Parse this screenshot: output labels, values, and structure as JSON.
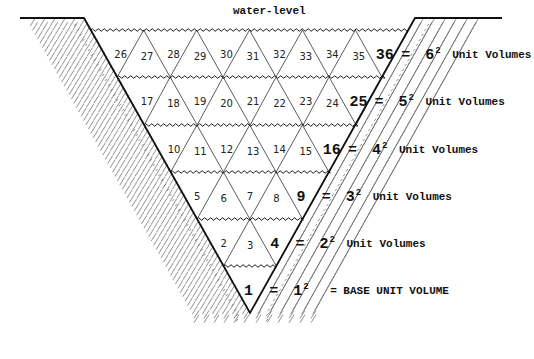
{
  "diagram": {
    "water_level_label": "water-level",
    "colors": {
      "ink": "#111111",
      "thin": "#333333",
      "hatch": "#444444"
    },
    "rows": [
      {
        "level": 6,
        "cells": [
          "26",
          "27",
          "28",
          "29",
          "30",
          "31",
          "32",
          "33",
          "34",
          "35"
        ],
        "total": "36",
        "eq": "=",
        "square": "6",
        "exp": "2",
        "label": "Unit Volumes"
      },
      {
        "level": 5,
        "cells": [
          "17",
          "18",
          "19",
          "20",
          "21",
          "22",
          "23",
          "24"
        ],
        "total": "25",
        "eq": "=",
        "square": "5",
        "exp": "2",
        "label": "Unit Volumes"
      },
      {
        "level": 4,
        "cells": [
          "10",
          "11",
          "12",
          "13",
          "14",
          "15"
        ],
        "total": "16",
        "eq": "=",
        "square": "4",
        "exp": "2",
        "label": "Unit Volumes"
      },
      {
        "level": 3,
        "cells": [
          "5",
          "6",
          "7",
          "8"
        ],
        "total": "9",
        "eq": "=",
        "square": "3",
        "exp": "2",
        "label": "Unit Volumes"
      },
      {
        "level": 2,
        "cells": [
          "2",
          "3"
        ],
        "total": "4",
        "eq": "=",
        "square": "2",
        "exp": "2",
        "label": "Unit Volumes"
      },
      {
        "level": 1,
        "cells": [],
        "total": "1",
        "eq": "=",
        "square": "1",
        "exp": "2",
        "label": "= BASE UNIT VOLUME"
      }
    ]
  }
}
